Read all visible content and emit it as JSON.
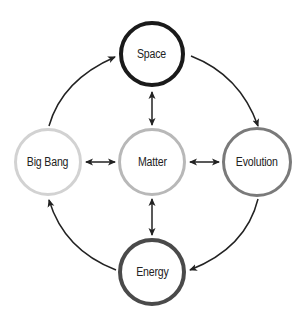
{
  "diagram": {
    "nodes": [
      {
        "id": "space",
        "label": "Space",
        "cx": 152,
        "cy": 54,
        "r": 33,
        "stroke": "#1a1a1a",
        "width": 4
      },
      {
        "id": "big-bang",
        "label": "Big Bang",
        "cx": 48,
        "cy": 162,
        "r": 34,
        "stroke": "#d2d2d2",
        "width": 3
      },
      {
        "id": "matter",
        "label": "Matter",
        "cx": 152,
        "cy": 162,
        "r": 34,
        "stroke": "#b8b8b8",
        "width": 3
      },
      {
        "id": "evolution",
        "label": "Evolution",
        "cx": 257,
        "cy": 162,
        "r": 35,
        "stroke": "#7a7a7a",
        "width": 3
      },
      {
        "id": "energy",
        "label": "Energy",
        "cx": 152,
        "cy": 272,
        "r": 34,
        "stroke": "#4a4a4a",
        "width": 4
      }
    ],
    "edges": [
      {
        "from": "big-bang",
        "to": "space",
        "type": "curved-one-way"
      },
      {
        "from": "space",
        "to": "evolution",
        "type": "curved-one-way"
      },
      {
        "from": "evolution",
        "to": "energy",
        "type": "curved-one-way"
      },
      {
        "from": "energy",
        "to": "big-bang",
        "type": "curved-one-way"
      },
      {
        "from": "matter",
        "to": "space",
        "type": "two-way"
      },
      {
        "from": "matter",
        "to": "big-bang",
        "type": "two-way"
      },
      {
        "from": "matter",
        "to": "evolution",
        "type": "two-way"
      },
      {
        "from": "matter",
        "to": "energy",
        "type": "two-way"
      }
    ]
  }
}
